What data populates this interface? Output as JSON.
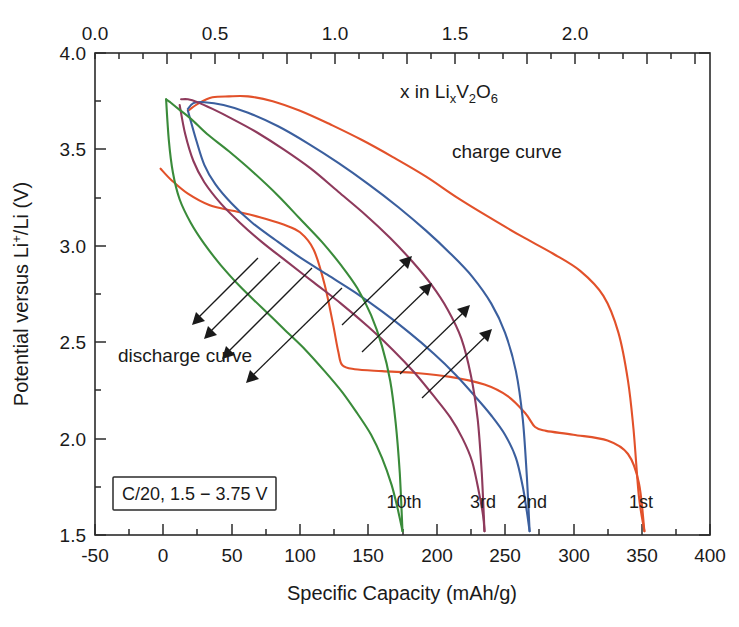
{
  "chart_data": {
    "type": "line",
    "title": "",
    "xlabel": "Specific Capacity (mAh/g)",
    "ylabel": "Potential versus Li+/Li (V)",
    "xlabel_top": "x in LixV2O6",
    "xlim": [
      -50,
      400
    ],
    "ylim": [
      1.5,
      4.0
    ],
    "xticks": [
      -50,
      0,
      50,
      100,
      150,
      200,
      250,
      300,
      350,
      400
    ],
    "xticklabels": [
      "-50",
      "0",
      "50",
      "100",
      "150",
      "200",
      "250",
      "300",
      "350",
      "400"
    ],
    "xminor_step": 25,
    "yticks": [
      1.5,
      2.0,
      2.5,
      3.0,
      3.5,
      4.0
    ],
    "yticklabels": [
      "1.5",
      "2.0",
      "2.5",
      "3.0",
      "3.5",
      "4.0"
    ],
    "yminor_step": 0.25,
    "top_axis": {
      "ticks": [
        0.0,
        0.5,
        1.0,
        1.5,
        2.0
      ],
      "ticklabels": [
        "0.0",
        "0.5",
        "1.0",
        "1.5",
        "2.0"
      ],
      "minor_step": 0.1,
      "label": "x in LixV2O6",
      "label_parts": {
        "lead": "x  in  Li",
        "sub1": "x",
        "mid": "V",
        "sub2": "2",
        "mid2": "O",
        "sub3": "6"
      }
    },
    "grid": false,
    "legend_position": "inline-labels",
    "condition_box": "C/20, 1.5 − 3.75 V",
    "annotations": [
      {
        "text": "charge curve",
        "x_px": 452,
        "y_px": 152
      },
      {
        "text": "discharge curve",
        "x_px": 118,
        "y_px": 356
      }
    ],
    "series": [
      {
        "name": "1st",
        "label": "1st",
        "color": "#e2512a",
        "cycle": 1,
        "charge_capacity_mAhg": 352,
        "discharge_capacity_mAhg": 352,
        "charge": [
          [
            -2,
            3.4
          ],
          [
            6,
            3.34
          ],
          [
            18,
            3.27
          ],
          [
            34,
            3.21
          ],
          [
            52,
            3.18
          ],
          [
            70,
            3.15
          ],
          [
            88,
            3.11
          ],
          [
            100,
            3.07
          ],
          [
            110,
            2.98
          ],
          [
            118,
            2.8
          ],
          [
            124,
            2.6
          ],
          [
            128,
            2.45
          ],
          [
            131,
            2.38
          ],
          [
            140,
            2.36
          ],
          [
            160,
            2.35
          ],
          [
            185,
            2.34
          ],
          [
            210,
            2.32
          ],
          [
            235,
            2.28
          ],
          [
            252,
            2.22
          ],
          [
            265,
            2.13
          ],
          [
            272,
            2.06
          ],
          [
            280,
            2.04
          ],
          [
            300,
            2.02
          ],
          [
            325,
            1.99
          ],
          [
            340,
            1.92
          ],
          [
            348,
            1.77
          ],
          [
            352,
            1.52
          ]
        ],
        "discharge": [
          [
            352,
            1.52
          ],
          [
            348,
            1.7
          ],
          [
            344,
            2.05
          ],
          [
            340,
            2.3
          ],
          [
            333,
            2.55
          ],
          [
            322,
            2.74
          ],
          [
            305,
            2.87
          ],
          [
            285,
            2.96
          ],
          [
            262,
            3.05
          ],
          [
            238,
            3.15
          ],
          [
            215,
            3.25
          ],
          [
            192,
            3.36
          ],
          [
            168,
            3.46
          ],
          [
            145,
            3.55
          ],
          [
            122,
            3.63
          ],
          [
            100,
            3.7
          ],
          [
            80,
            3.75
          ],
          [
            62,
            3.775
          ],
          [
            48,
            3.775
          ],
          [
            36,
            3.77
          ],
          [
            26,
            3.74
          ],
          [
            18,
            3.7
          ]
        ]
      },
      {
        "name": "2nd",
        "label": "2nd",
        "color": "#3b5f9e",
        "cycle": 2,
        "charge_capacity_mAhg": 268,
        "discharge_capacity_mAhg": 268,
        "charge": [
          [
            18,
            3.7
          ],
          [
            24,
            3.55
          ],
          [
            30,
            3.42
          ],
          [
            38,
            3.32
          ],
          [
            50,
            3.22
          ],
          [
            65,
            3.12
          ],
          [
            82,
            3.03
          ],
          [
            100,
            2.94
          ],
          [
            120,
            2.85
          ],
          [
            140,
            2.76
          ],
          [
            160,
            2.66
          ],
          [
            180,
            2.55
          ],
          [
            198,
            2.44
          ],
          [
            214,
            2.33
          ],
          [
            228,
            2.22
          ],
          [
            240,
            2.12
          ],
          [
            250,
            2.02
          ],
          [
            258,
            1.9
          ],
          [
            263,
            1.75
          ],
          [
            266,
            1.62
          ],
          [
            268,
            1.52
          ]
        ],
        "discharge": [
          [
            268,
            1.52
          ],
          [
            266,
            1.8
          ],
          [
            263,
            2.1
          ],
          [
            258,
            2.35
          ],
          [
            250,
            2.55
          ],
          [
            240,
            2.7
          ],
          [
            226,
            2.84
          ],
          [
            210,
            2.96
          ],
          [
            192,
            3.08
          ],
          [
            172,
            3.2
          ],
          [
            150,
            3.32
          ],
          [
            128,
            3.43
          ],
          [
            106,
            3.53
          ],
          [
            84,
            3.62
          ],
          [
            62,
            3.69
          ],
          [
            44,
            3.73
          ],
          [
            30,
            3.745
          ],
          [
            22,
            3.74
          ],
          [
            18,
            3.71
          ]
        ]
      },
      {
        "name": "3rd",
        "label": "3rd",
        "color": "#8e3a5c",
        "cycle": 3,
        "charge_capacity_mAhg": 235,
        "discharge_capacity_mAhg": 235,
        "charge": [
          [
            12,
            3.73
          ],
          [
            16,
            3.58
          ],
          [
            22,
            3.44
          ],
          [
            30,
            3.33
          ],
          [
            42,
            3.22
          ],
          [
            56,
            3.12
          ],
          [
            72,
            3.02
          ],
          [
            90,
            2.92
          ],
          [
            110,
            2.81
          ],
          [
            130,
            2.7
          ],
          [
            150,
            2.58
          ],
          [
            168,
            2.46
          ],
          [
            184,
            2.34
          ],
          [
            198,
            2.22
          ],
          [
            210,
            2.11
          ],
          [
            219,
            2.0
          ],
          [
            226,
            1.88
          ],
          [
            231,
            1.72
          ],
          [
            234,
            1.6
          ],
          [
            235,
            1.52
          ]
        ],
        "discharge": [
          [
            235,
            1.52
          ],
          [
            233,
            1.82
          ],
          [
            230,
            2.1
          ],
          [
            225,
            2.33
          ],
          [
            218,
            2.52
          ],
          [
            208,
            2.67
          ],
          [
            196,
            2.8
          ],
          [
            182,
            2.92
          ],
          [
            166,
            3.04
          ],
          [
            148,
            3.16
          ],
          [
            128,
            3.28
          ],
          [
            108,
            3.4
          ],
          [
            88,
            3.5
          ],
          [
            68,
            3.59
          ],
          [
            50,
            3.66
          ],
          [
            36,
            3.71
          ],
          [
            25,
            3.745
          ],
          [
            18,
            3.76
          ],
          [
            13,
            3.76
          ]
        ]
      },
      {
        "name": "10th",
        "label": "10th",
        "color": "#3a8b3a",
        "cycle": 10,
        "charge_capacity_mAhg": 175,
        "discharge_capacity_mAhg": 175,
        "charge": [
          [
            2,
            3.76
          ],
          [
            4,
            3.55
          ],
          [
            7,
            3.38
          ],
          [
            12,
            3.24
          ],
          [
            20,
            3.12
          ],
          [
            30,
            3.01
          ],
          [
            42,
            2.9
          ],
          [
            56,
            2.79
          ],
          [
            72,
            2.68
          ],
          [
            88,
            2.57
          ],
          [
            104,
            2.46
          ],
          [
            118,
            2.35
          ],
          [
            131,
            2.24
          ],
          [
            142,
            2.13
          ],
          [
            152,
            2.02
          ],
          [
            160,
            1.9
          ],
          [
            167,
            1.76
          ],
          [
            172,
            1.62
          ],
          [
            175,
            1.52
          ]
        ],
        "discharge": [
          [
            175,
            1.52
          ],
          [
            173,
            1.82
          ],
          [
            170,
            2.08
          ],
          [
            166,
            2.3
          ],
          [
            160,
            2.48
          ],
          [
            152,
            2.64
          ],
          [
            142,
            2.78
          ],
          [
            130,
            2.9
          ],
          [
            116,
            3.02
          ],
          [
            100,
            3.14
          ],
          [
            84,
            3.26
          ],
          [
            66,
            3.38
          ],
          [
            48,
            3.49
          ],
          [
            32,
            3.58
          ],
          [
            20,
            3.66
          ],
          [
            11,
            3.71
          ],
          [
            5,
            3.745
          ],
          [
            2,
            3.76
          ]
        ]
      }
    ],
    "cycle_labels": [
      {
        "text": "10th",
        "x_px": 404,
        "y_px": 501,
        "color": "#3a8b3a"
      },
      {
        "text": "3rd",
        "x_px": 483,
        "y_px": 501,
        "color": "#8e3a5c"
      },
      {
        "text": "2nd",
        "x_px": 532,
        "y_px": 501,
        "color": "#3b5f9e"
      },
      {
        "text": "1st",
        "x_px": 641,
        "y_px": 501,
        "color": "#e2512a"
      }
    ]
  },
  "colors": {
    "axis": "#2b2b2b",
    "text": "#1a1a1a",
    "background": "#ffffff",
    "cycle1": "#e2512a",
    "cycle2": "#3b5f9e",
    "cycle3": "#8e3a5c",
    "cycle10": "#3a8b3a"
  }
}
